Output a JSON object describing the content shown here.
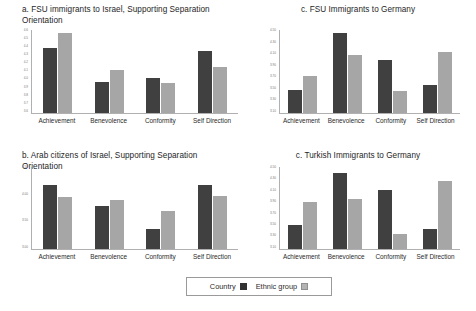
{
  "legend": {
    "series": [
      {
        "name": "Country",
        "label": "Country",
        "color": "#404040",
        "swatch": "filled-dark-square-icon"
      },
      {
        "name": "Ethnic group",
        "label": "Ethnic group",
        "color": "#a6a6a6",
        "swatch": "filled-light-square-icon"
      }
    ]
  },
  "panels": [
    {
      "id": "panel-a",
      "title": "a. FSU immigrants to Israel, Supporting Separation\nOrientation",
      "chart_data": {
        "type": "bar",
        "title": "a. FSU immigrants to Israel, Supporting Separation Orientation",
        "categories": [
          "Achievement",
          "Benevolence",
          "Conformity",
          "Self Direction"
        ],
        "series": [
          {
            "name": "Country",
            "values": [
              4.25,
              3.8,
              3.9,
              4.2
            ]
          },
          {
            "name": "Ethnic group",
            "values": [
              4.55,
              4.0,
              3.85,
              4.05
            ]
          }
        ],
        "ytick_labels": [
          "4.6",
          "4.5",
          "4.4",
          "4.3",
          "4.2",
          "4.1",
          "4.0",
          "3.9",
          "3.8",
          "3.7",
          "3.6"
        ],
        "ylim": [
          3.6,
          4.6
        ],
        "xlabel": "",
        "ylabel": "",
        "grid": false,
        "legend_position": "bottom-shared"
      },
      "bars": [
        {
          "category": "Achievement",
          "country_frac": 0.78,
          "ethnic_frac": 0.97
        },
        {
          "category": "Benevolence",
          "country_frac": 0.37,
          "ethnic_frac": 0.52
        },
        {
          "category": "Conformity",
          "country_frac": 0.42,
          "ethnic_frac": 0.36
        },
        {
          "category": "Self Direction",
          "country_frac": 0.75,
          "ethnic_frac": 0.56
        }
      ]
    },
    {
      "id": "panel-b",
      "title": "b. Arab citizens of Israel, Supporting Separation Orientation",
      "chart_data": {
        "type": "bar",
        "title": "b. Arab citizens of Israel, Supporting Separation Orientation",
        "categories": [
          "Achievement",
          "Benevolence",
          "Conformity",
          "Self Direction"
        ],
        "series": [
          {
            "name": "Country",
            "values": [
              4.4,
              4.0,
              3.6,
              4.4
            ]
          },
          {
            "name": "Ethnic group",
            "values": [
              4.25,
              4.1,
              3.9,
              4.25
            ]
          }
        ],
        "ytick_labels": [
          "4.50",
          "4.00",
          "3.50",
          "3.00"
        ],
        "ylim": [
          3.0,
          4.5
        ],
        "xlabel": "",
        "ylabel": "",
        "grid": false,
        "legend_position": "bottom-shared"
      },
      "bars": [
        {
          "category": "Achievement",
          "country_frac": 0.78,
          "ethnic_frac": 0.64
        },
        {
          "category": "Benevolence",
          "country_frac": 0.52,
          "ethnic_frac": 0.6
        },
        {
          "category": "Conformity",
          "country_frac": 0.25,
          "ethnic_frac": 0.46
        },
        {
          "category": "Self Direction",
          "country_frac": 0.78,
          "ethnic_frac": 0.65
        }
      ]
    },
    {
      "id": "panel-c1",
      "title": "c. FSU Immigrants to Germany",
      "chart_data": {
        "type": "bar",
        "title": "c. FSU Immigrants to Germany",
        "categories": [
          "Achievement",
          "Benevolence",
          "Conformity",
          "Self Direction"
        ],
        "series": [
          {
            "name": "Country",
            "values": [
              3.6,
              4.5,
              4.05,
              3.7
            ]
          },
          {
            "name": "Ethnic group",
            "values": [
              3.8,
              4.2,
              3.55,
              4.3
            ]
          }
        ],
        "ytick_labels": [
          "4.50",
          "4.30",
          "4.10",
          "3.90",
          "3.70",
          "3.50",
          "3.30",
          "3.10"
        ],
        "ylim": [
          3.1,
          4.5
        ],
        "xlabel": "",
        "ylabel": "",
        "grid": false,
        "legend_position": "bottom-shared"
      },
      "bars": [
        {
          "category": "Achievement",
          "country_frac": 0.28,
          "ethnic_frac": 0.45
        },
        {
          "category": "Benevolence",
          "country_frac": 0.97,
          "ethnic_frac": 0.7
        },
        {
          "category": "Conformity",
          "country_frac": 0.64,
          "ethnic_frac": 0.26
        },
        {
          "category": "Self Direction",
          "country_frac": 0.34,
          "ethnic_frac": 0.74
        }
      ]
    },
    {
      "id": "panel-c2",
      "title": "c. Turkish Immigrants to Germany",
      "chart_data": {
        "type": "bar",
        "title": "c. Turkish Immigrants to Germany",
        "categories": [
          "Achievement",
          "Benevolence",
          "Conformity",
          "Self Direction"
        ],
        "series": [
          {
            "name": "Country",
            "values": [
              3.6,
              4.45,
              4.1,
              3.55
            ]
          },
          {
            "name": "Ethnic group",
            "values": [
              3.95,
              4.05,
              3.4,
              4.3
            ]
          }
        ],
        "ytick_labels": [
          "4.50",
          "4.30",
          "4.10",
          "3.90",
          "3.70",
          "3.50",
          "3.30",
          "3.10"
        ],
        "ylim": [
          3.1,
          4.5
        ],
        "xlabel": "",
        "ylabel": "",
        "grid": false,
        "legend_position": "bottom-shared"
      },
      "bars": [
        {
          "category": "Achievement",
          "country_frac": 0.29,
          "ethnic_frac": 0.57
        },
        {
          "category": "Benevolence",
          "country_frac": 0.93,
          "ethnic_frac": 0.61
        },
        {
          "category": "Conformity",
          "country_frac": 0.72,
          "ethnic_frac": 0.18
        },
        {
          "category": "Self Direction",
          "country_frac": 0.25,
          "ethnic_frac": 0.83
        }
      ]
    }
  ]
}
